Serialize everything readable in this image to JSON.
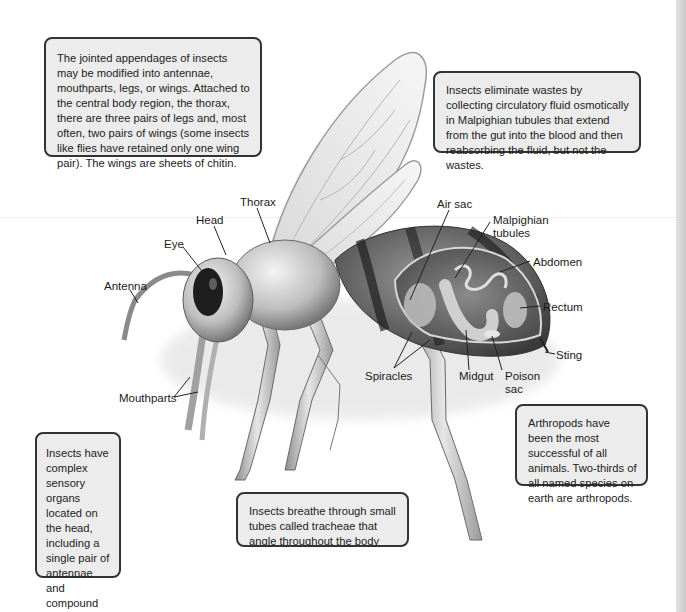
{
  "diagram": {
    "info_boxes": {
      "appendages": "The jointed appendages of insects may be modified into antennae, mouthparts, legs, or wings. Attached to the central body region, the thorax, there are three pairs of legs and, most often, two pairs of wings (some insects like flies have retained only one wing pair). The wings are sheets of chitin.",
      "excretion": "Insects eliminate wastes by collecting circulatory fluid osmotically in Malpighian tubules that extend from the gut into the blood and then reabsorbing the fluid, but not the wastes.",
      "success": "Arthropods have been the most successful of all animals. Two-thirds of all named species on earth are arthropods.",
      "sensory": "Insects have complex sensory organs located on the head, including a single pair of antennae and compound eyes composed of many independent visual units.",
      "respiration": "Insects breathe through small tubes called tracheae that angle throughout the body and are connected to the outside by special openings called spiracles."
    },
    "labels": {
      "thorax": "Thorax",
      "head": "Head",
      "eye": "Eye",
      "antenna": "Antenna",
      "mouthparts": "Mouthparts",
      "air_sac": "Air sac",
      "malpighian_1": "Malpighian",
      "malpighian_2": "tubules",
      "abdomen": "Abdomen",
      "rectum": "Rectum",
      "sting": "Sting",
      "spiracles": "Spiracles",
      "midgut": "Midgut",
      "poison_sac_1": "Poison",
      "poison_sac_2": "sac"
    },
    "colors": {
      "box_fill": "#ececec",
      "box_border": "#333333",
      "text": "#1a1a1a"
    }
  }
}
